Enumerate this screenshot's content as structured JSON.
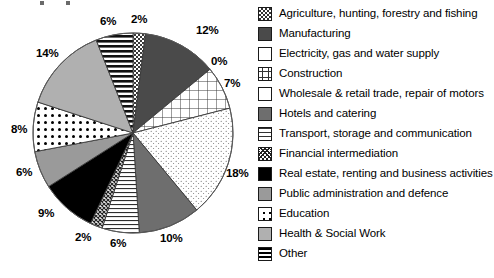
{
  "chart_data": {
    "type": "pie",
    "title": "",
    "subtitle": "",
    "xlabel": "",
    "ylabel": "",
    "legend_position": "right",
    "grid": false,
    "units": "percent",
    "start_angle_deg": 0,
    "direction": "clockwise",
    "categories": [
      "Agriculture, hunting, forestry and fishing",
      "Manufacturing",
      "Electricity, gas and water supply",
      "Construction",
      "Wholesale & retail trade, repair of motors",
      "Hotels and catering",
      "Transport, storage and communication",
      "Financial intermediation",
      "Real estate, renting and business activities",
      "Public administration and defence",
      "Education",
      "Health & Social Work",
      "Other"
    ],
    "values": [
      2,
      12,
      0,
      7,
      18,
      10,
      6,
      2,
      9,
      6,
      8,
      14,
      6
    ],
    "data_labels": [
      "2%",
      "12%",
      "0%",
      "7%",
      "18%",
      "10%",
      "6%",
      "2%",
      "9%",
      "6%",
      "8%",
      "14%",
      "6%"
    ],
    "patterns": [
      "checkerboard",
      "solid-dark-gray",
      "white",
      "grid-lines",
      "fine-speckle",
      "solid-medium-gray",
      "horizontal-thin-lines",
      "dense-crosshatch",
      "solid-black",
      "solid-light-gray",
      "large-dots",
      "solid-pale-gray",
      "thick-horizontal-bands"
    ],
    "colors": [
      "#d9d9d9",
      "#4a4a4a",
      "#ffffff",
      "#ffffff",
      "#fbfbfb",
      "#6e6e6e",
      "#ffffff",
      "#cfcfcf",
      "#000000",
      "#9a9a9a",
      "#ffffff",
      "#b0b0b0",
      "#ffffff"
    ]
  },
  "labels": [
    {
      "text": "2%",
      "name": "slice-label-agriculture"
    },
    {
      "text": "12%",
      "name": "slice-label-manufacturing"
    },
    {
      "text": "0%",
      "name": "slice-label-electricity"
    },
    {
      "text": "7%",
      "name": "slice-label-construction"
    },
    {
      "text": "18%",
      "name": "slice-label-wholesale"
    },
    {
      "text": "10%",
      "name": "slice-label-hotels"
    },
    {
      "text": "6%",
      "name": "slice-label-transport"
    },
    {
      "text": "2%",
      "name": "slice-label-financial"
    },
    {
      "text": "9%",
      "name": "slice-label-real-estate"
    },
    {
      "text": "6%",
      "name": "slice-label-public-admin"
    },
    {
      "text": "8%",
      "name": "slice-label-education"
    },
    {
      "text": "14%",
      "name": "slice-label-health"
    },
    {
      "text": "6%",
      "name": "slice-label-other"
    }
  ],
  "legend": {
    "items": [
      {
        "label": "Agriculture, hunting, forestry and fishing",
        "swatch": "sw-agriculture",
        "key": "agriculture"
      },
      {
        "label": "Manufacturing",
        "swatch": "sw-manufacturing",
        "key": "manufacturing"
      },
      {
        "label": "Electricity, gas and water supply",
        "swatch": "sw-electricity",
        "key": "electricity"
      },
      {
        "label": "Construction",
        "swatch": "sw-construction",
        "key": "construction"
      },
      {
        "label": "Wholesale & retail trade, repair of motors",
        "swatch": "sw-wholesale",
        "key": "wholesale"
      },
      {
        "label": "Hotels and catering",
        "swatch": "sw-hotels",
        "key": "hotels"
      },
      {
        "label": "Transport, storage and communication",
        "swatch": "sw-transport",
        "key": "transport"
      },
      {
        "label": "Financial intermediation",
        "swatch": "sw-financial",
        "key": "financial"
      },
      {
        "label": "Real estate, renting and business activities",
        "swatch": "sw-realestate",
        "key": "real-estate"
      },
      {
        "label": "Public administration and defence",
        "swatch": "sw-publicadmin",
        "key": "public-admin"
      },
      {
        "label": "Education",
        "swatch": "sw-education",
        "key": "education"
      },
      {
        "label": "Health & Social Work",
        "swatch": "sw-health",
        "key": "health"
      },
      {
        "label": "Other",
        "swatch": "sw-other",
        "key": "other"
      }
    ]
  }
}
